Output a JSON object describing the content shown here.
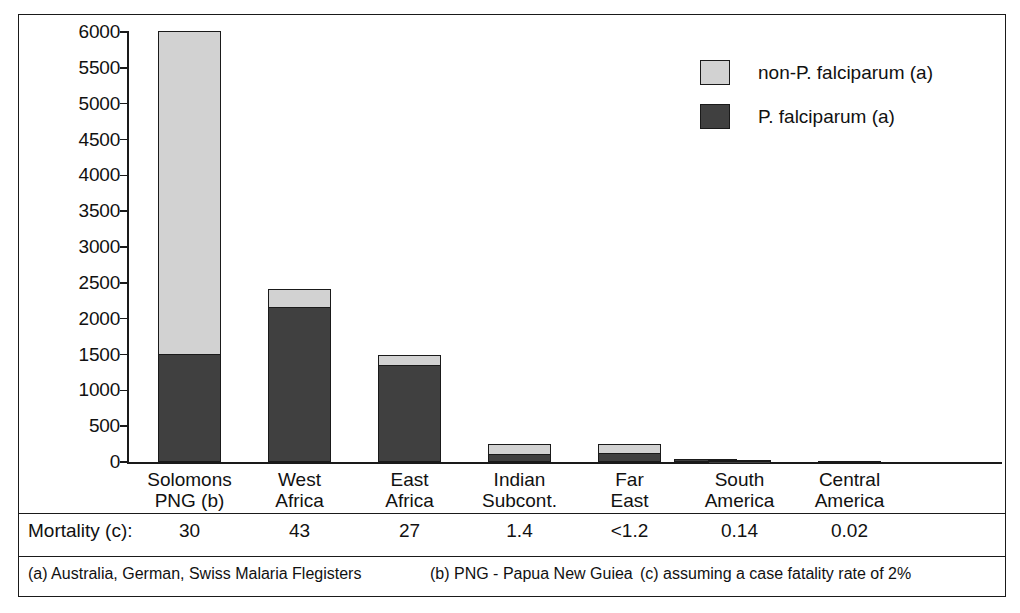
{
  "chart_data": {
    "type": "bar",
    "subtype": "stacked-bar",
    "title": "",
    "xlabel": "",
    "ylabel": "",
    "ylim": [
      0,
      6000
    ],
    "yticks": [
      0,
      500,
      1000,
      1500,
      2000,
      2500,
      3000,
      3500,
      4000,
      4500,
      5000,
      5500,
      6000
    ],
    "ytick_labels": [
      "0",
      "500",
      "1000",
      "1500",
      "2000",
      "2500",
      "3000",
      "3500",
      "4000",
      "4500",
      "5000",
      "5500",
      "6000"
    ],
    "grid": false,
    "legend_position": "top-right",
    "categories": [
      "Solomons PNG (b)",
      "West Africa",
      "East Africa",
      "Indian Subcont.",
      "Far East",
      "South America",
      "Central America"
    ],
    "series": [
      {
        "name": "P. falciparum (a)",
        "color": "#404040",
        "values": [
          1500,
          2150,
          1340,
          100,
          110,
          30,
          18
        ]
      },
      {
        "name": "non-P. falciparum (a)",
        "color": "#d2d2d2",
        "values": [
          4510,
          270,
          150,
          150,
          140,
          5,
          2
        ]
      }
    ],
    "totals": [
      6010,
      2420,
      1490,
      250,
      250,
      35,
      20
    ],
    "extra_bars": [
      {
        "after_category": "Far East",
        "dark": 40,
        "light": 0,
        "label": ""
      }
    ]
  },
  "legend": {
    "items": [
      {
        "label": "non-P. falciparum (a)",
        "swatch": "light"
      },
      {
        "label": "P. falciparum (a)",
        "swatch": "dark"
      }
    ]
  },
  "axis": {
    "ticks": [
      "6000",
      "5500",
      "5000",
      "4500",
      "4000",
      "3500",
      "3000",
      "2500",
      "2000",
      "1500",
      "1000",
      "500",
      "0"
    ]
  },
  "categories": [
    {
      "line1": "Solomons",
      "line2": "PNG (b)"
    },
    {
      "line1": "West",
      "line2": "Africa"
    },
    {
      "line1": "East",
      "line2": "Africa"
    },
    {
      "line1": "Indian",
      "line2": "Subcont."
    },
    {
      "line1": "Far",
      "line2": "East"
    },
    {
      "line1": "South",
      "line2": "America"
    },
    {
      "line1": "Central",
      "line2": "America"
    }
  ],
  "mortality": {
    "row_label": "Mortality (c):",
    "values": [
      "30",
      "43",
      "27",
      "1.4",
      "<1.2",
      "0.14",
      "0.02"
    ]
  },
  "footnotes": [
    "(a) Australia, German, Swiss Malaria Flegisters",
    "(b) PNG - Papua New Guiea",
    "(c) assuming a case fatality rate of 2%"
  ],
  "colors": {
    "dark_segment": "#404040",
    "light_segment": "#d2d2d2",
    "outline": "#1a1a1a",
    "background": "#ffffff"
  }
}
